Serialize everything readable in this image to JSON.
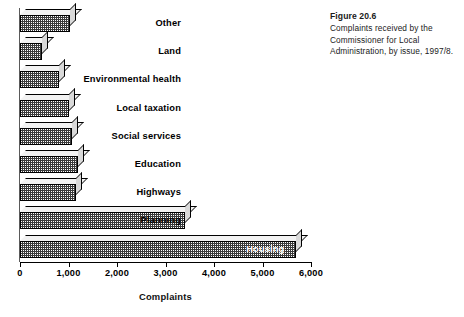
{
  "caption": {
    "figure_number": "Figure 20.6",
    "description": "Complaints received by the Commissioner for Local Administration, by issue, 1997/8."
  },
  "chart_data": {
    "type": "bar",
    "orientation": "horizontal",
    "title": "Complaints received by the Commissioner for Local Administration, by issue, 1997/8.",
    "xlabel": "Complaints",
    "ylabel": "",
    "xlim": [
      0,
      6000
    ],
    "grid": false,
    "legend": "none",
    "xticks": [
      0,
      1000,
      2000,
      3000,
      4000,
      5000,
      6000
    ],
    "xticklabels": [
      "0",
      "1,000",
      "2,000",
      "3,000",
      "4,000",
      "5,000",
      "6,000"
    ],
    "categories": [
      "Other",
      "Land",
      "Environmental health",
      "Local taxation",
      "Social services",
      "Education",
      "Highways",
      "Planning",
      "Housing"
    ],
    "values": [
      1030,
      450,
      800,
      1000,
      1080,
      1200,
      1150,
      3400,
      5700
    ],
    "bars": [
      {
        "label": "Other",
        "value": 1030,
        "label_position": "outside"
      },
      {
        "label": "Land",
        "value": 450,
        "label_position": "outside"
      },
      {
        "label": "Environmental health",
        "value": 800,
        "label_position": "outside"
      },
      {
        "label": "Local taxation",
        "value": 1000,
        "label_position": "outside"
      },
      {
        "label": "Social services",
        "value": 1080,
        "label_position": "outside"
      },
      {
        "label": "Education",
        "value": 1200,
        "label_position": "outside"
      },
      {
        "label": "Highways",
        "value": 1150,
        "label_position": "outside"
      },
      {
        "label": "Planning",
        "value": 3400,
        "label_position": "outside"
      },
      {
        "label": "Housing",
        "value": 5700,
        "label_position": "inside"
      }
    ],
    "colors": {
      "bar_face": "#3a3a3a",
      "bar_top": "#f2f2f2",
      "bar_side": "#d9d9d9",
      "axis": "#000000",
      "background": "#ffffff",
      "inside_label": "#ffffff"
    }
  }
}
